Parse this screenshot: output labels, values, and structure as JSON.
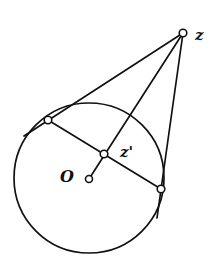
{
  "diagram": {
    "type": "geometry",
    "colors": {
      "stroke": "#111111",
      "background": "#ffffff"
    },
    "labels": {
      "z": "z",
      "z_prime": "z'",
      "O": "O"
    },
    "points": {
      "z": [
        183,
        33
      ],
      "tangent_left": [
        48,
        120
      ],
      "tangent_right": [
        161,
        189
      ],
      "z_prime": [
        104,
        154
      ],
      "O": [
        89,
        179
      ]
    },
    "circle": {
      "center": [
        89,
        178
      ],
      "radius": 75
    }
  }
}
